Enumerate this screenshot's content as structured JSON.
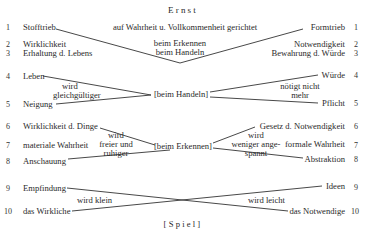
{
  "title": "Ernst",
  "footer": "[Spiel]",
  "top": {
    "subtitle": "auf Wahrheit u. Vollkommenheit gerichtet",
    "center_lines": [
      "beim Erkennen",
      "beim Handeln"
    ],
    "left": [
      {
        "num": "1",
        "label": "Stofftrieb"
      },
      {
        "num": "2",
        "label": "Wirklichkeit"
      },
      {
        "num": "3",
        "label": "Erhaltung d. Lebens"
      }
    ],
    "right": [
      {
        "num": "1",
        "label": "Formtrieb"
      },
      {
        "num": "2",
        "label": "Notwendigkeit"
      },
      {
        "num": "3",
        "label": "Bewahrung d. Würde"
      }
    ]
  },
  "handeln": {
    "center": "[beim Handeln]",
    "left": [
      {
        "num": "4",
        "label": "Leben"
      },
      {
        "num": "5",
        "label": "Neigung"
      }
    ],
    "left_note": [
      "wird",
      "gleichgültiger"
    ],
    "right": [
      {
        "num": "4",
        "label": "Würde"
      },
      {
        "num": "5",
        "label": "Pflicht"
      }
    ],
    "right_note": [
      "nötigt nicht",
      "mehr"
    ]
  },
  "erkennen": {
    "center": "[beim Erkennen]",
    "left": [
      {
        "num": "6",
        "label": "Wirklichkeit d. Dinge"
      },
      {
        "num": "7",
        "label": "materiale Wahrheit"
      },
      {
        "num": "8",
        "label": "Anschauung"
      }
    ],
    "left_note": [
      "wird",
      "freier und",
      "ruhiger"
    ],
    "right": [
      {
        "num": "6",
        "label": "Gesetz d. Notwendigkeit"
      },
      {
        "num": "7",
        "label": "formale Wahrheit"
      },
      {
        "num": "8",
        "label": "Abstraktion"
      }
    ],
    "right_note": [
      "wird",
      "weniger ange-",
      "spannt"
    ]
  },
  "spiel": {
    "left": [
      {
        "num": "9",
        "label": "Empfindung"
      },
      {
        "num": "10",
        "label": "das Wirkliche"
      }
    ],
    "left_note": "wird klein",
    "right": [
      {
        "num": "9",
        "label": "Ideen"
      },
      {
        "num": "10",
        "label": "das Notwendige"
      }
    ],
    "right_note": "wird leicht"
  }
}
